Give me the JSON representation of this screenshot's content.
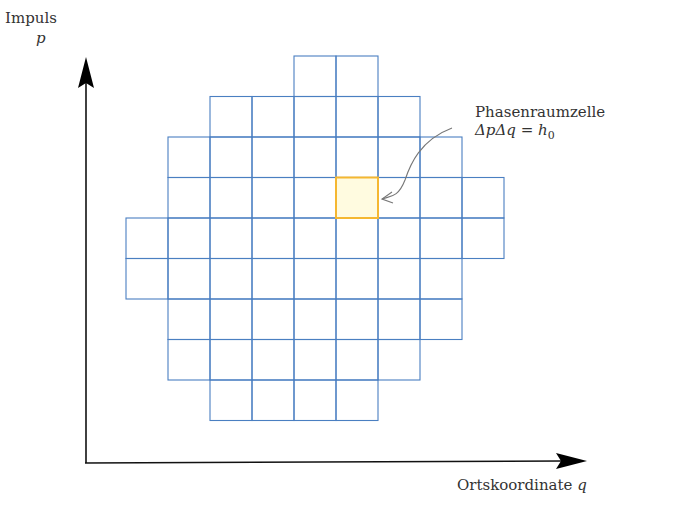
{
  "axes": {
    "y_label": "Impuls",
    "y_symbol": "p",
    "x_label": "Ortskoordinate",
    "x_symbol": "q",
    "color": "#000000"
  },
  "annotation": {
    "title": "Phasenraumzelle",
    "formula_prefix": "ΔpΔq = h",
    "formula_subscript": "0",
    "arrow_color": "#777777"
  },
  "grid": {
    "cell_width": 42,
    "cell_height": 40.5,
    "origin_x": 126,
    "origin_y": 56,
    "line_color": "#4a7fc1",
    "rows": [
      {
        "row": 0,
        "from_col": 4,
        "to_col": 5
      },
      {
        "row": 1,
        "from_col": 2,
        "to_col": 6
      },
      {
        "row": 2,
        "from_col": 1,
        "to_col": 7
      },
      {
        "row": 3,
        "from_col": 1,
        "to_col": 8
      },
      {
        "row": 4,
        "from_col": 0,
        "to_col": 8
      },
      {
        "row": 5,
        "from_col": 0,
        "to_col": 7
      },
      {
        "row": 6,
        "from_col": 1,
        "to_col": 7
      },
      {
        "row": 7,
        "from_col": 1,
        "to_col": 6
      },
      {
        "row": 8,
        "from_col": 2,
        "to_col": 5
      }
    ],
    "highlight": {
      "row": 3,
      "col": 5,
      "fill": "#fffbe0",
      "stroke": "#f5b731"
    }
  }
}
